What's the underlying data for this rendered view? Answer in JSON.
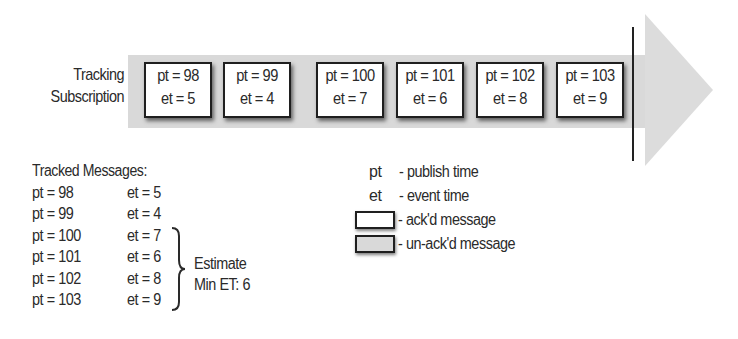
{
  "stream": {
    "label_line1": "Tracking",
    "label_line2": "Subscription",
    "band_color": "#d9d9d9",
    "messages": [
      {
        "pt": "pt = 98",
        "et": "et = 5"
      },
      {
        "pt": "pt = 99",
        "et": "et = 4"
      },
      {
        "pt": "pt = 100",
        "et": "et = 7"
      },
      {
        "pt": "pt = 101",
        "et": "et = 6"
      },
      {
        "pt": "pt = 102",
        "et": "et = 8"
      },
      {
        "pt": "pt = 103",
        "et": "et = 9"
      }
    ]
  },
  "tracked": {
    "title": "Tracked Messages:",
    "rows": [
      {
        "pt": "pt = 98",
        "et": "et = 5"
      },
      {
        "pt": "pt = 99",
        "et": "et = 4"
      },
      {
        "pt": "pt = 100",
        "et": "et = 7"
      },
      {
        "pt": "pt = 101",
        "et": "et = 6"
      },
      {
        "pt": "pt = 102",
        "et": "et = 8"
      },
      {
        "pt": "pt = 103",
        "et": "et = 9"
      }
    ],
    "estimate_line1": "Estimate",
    "estimate_line2": "Min ET: 6"
  },
  "legend": {
    "items": [
      {
        "key": "pt",
        "desc": "- publish time"
      },
      {
        "key": "et",
        "desc": "- event time"
      },
      {
        "key": "",
        "desc": "- ack'd message",
        "swatch": "#ffffff"
      },
      {
        "key": "",
        "desc": "- un-ack'd message",
        "swatch": "#d9d9d9"
      }
    ]
  }
}
